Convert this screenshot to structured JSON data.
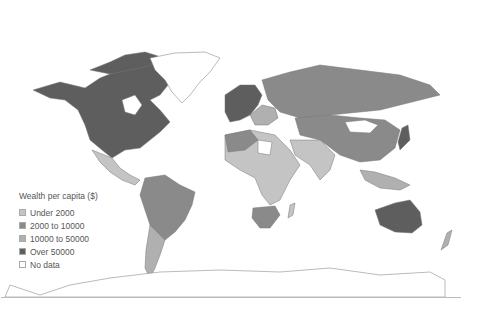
{
  "legend": {
    "title": "Wealth per capita ($)",
    "items": [
      {
        "label": "Under 2000",
        "color": "#c4c4c4"
      },
      {
        "label": "2000 to 10000",
        "color": "#8a8a8a"
      },
      {
        "label": "10000 to 50000",
        "color": "#b0b0b0"
      },
      {
        "label": "Over 50000",
        "color": "#5e5e5e"
      },
      {
        "label": "No data",
        "color": "#ffffff"
      }
    ]
  },
  "colors": {
    "background": "#ffffff",
    "border": "#777777",
    "over_50000": "#5e5e5e",
    "c2000_10000": "#8a8a8a",
    "c10000_50000": "#b0b0b0",
    "under_2000": "#c4c4c4",
    "no_data": "#ffffff"
  }
}
